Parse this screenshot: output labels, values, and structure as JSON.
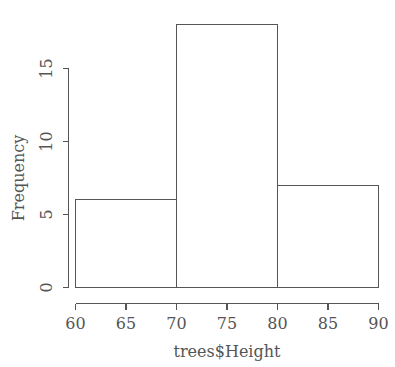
{
  "chart_data": {
    "type": "bar",
    "title": "",
    "subtitle": "",
    "xlabel": "trees$Height",
    "ylabel": "Frequency",
    "categories": [
      "60-70",
      "70-80",
      "80-90"
    ],
    "bin_edges": [
      60,
      70,
      80,
      90
    ],
    "values": [
      6,
      18,
      7
    ],
    "x": [
      65,
      75,
      85
    ],
    "xlim": [
      60,
      90
    ],
    "ylim": [
      0,
      18
    ],
    "xticks": [
      60,
      65,
      70,
      75,
      80,
      85,
      90
    ],
    "xtick_labels": [
      "60",
      "65",
      "70",
      "75",
      "80",
      "85",
      "90"
    ],
    "yticks": [
      0,
      5,
      10,
      15
    ],
    "ytick_labels": [
      "0",
      "5",
      "10",
      "15"
    ],
    "grid": false,
    "legend": false,
    "legend_position": "none",
    "series": [
      {
        "name": "Frequency",
        "values": [
          6,
          18,
          7
        ]
      }
    ],
    "style": {
      "bar_fill": "none",
      "bar_stroke": "#555555",
      "axis_color": "#555555",
      "background": "#ffffff",
      "ytick_label_rotation": 90
    }
  }
}
